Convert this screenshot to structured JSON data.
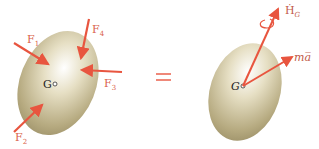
{
  "diagram": {
    "left_body": {
      "center_label": "G",
      "forces": [
        {
          "name": "F",
          "sub": "1"
        },
        {
          "name": "F",
          "sub": "2"
        },
        {
          "name": "F",
          "sub": "3"
        },
        {
          "name": "F",
          "sub": "4"
        }
      ]
    },
    "equals": "=",
    "right_body": {
      "center_label": "G",
      "angular_momentum_rate": {
        "name": "Ḣ",
        "sub": "G"
      },
      "linear": "ma̅"
    },
    "colors": {
      "arrow": "#e8553f",
      "label": "#d9614a",
      "body": "#c9bf9a"
    }
  }
}
